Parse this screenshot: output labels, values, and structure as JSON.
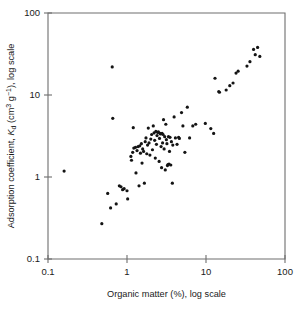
{
  "chart_data": {
    "type": "scatter",
    "title": "",
    "xlabel": "Organic matter (%), log scale",
    "ylabel": "Adsorption coefficient, Kd (cm3 g-1), log scale",
    "ylabel_parts": {
      "prefix": "Adsorption coefficient, ",
      "symbol": "K",
      "subscript": "d",
      "unit_open": " (cm",
      "unit_sup1": "3",
      "unit_mid": " g",
      "unit_sup2": "-1",
      "unit_close": "), log scale"
    },
    "xscale": "log",
    "yscale": "log",
    "xlim": [
      0.1,
      100
    ],
    "ylim": [
      0.1,
      100
    ],
    "xticks": [
      0.1,
      1,
      10,
      100
    ],
    "xtick_labels": [
      "0.1",
      "1",
      "10",
      "100"
    ],
    "yticks": [
      0.1,
      1,
      10,
      100
    ],
    "ytick_labels": [
      "0.1",
      "1",
      "10",
      "100"
    ],
    "grid": false,
    "legend": false,
    "marker": "filled-circle",
    "marker_color": "#141414",
    "marker_size_px": 3.2,
    "n_points": 104,
    "points": [
      [
        0.16,
        1.18
      ],
      [
        0.48,
        0.27
      ],
      [
        0.57,
        0.63
      ],
      [
        0.62,
        0.42
      ],
      [
        0.65,
        22.0
      ],
      [
        0.66,
        5.2
      ],
      [
        0.73,
        0.47
      ],
      [
        0.8,
        0.78
      ],
      [
        0.84,
        0.76
      ],
      [
        0.88,
        0.7
      ],
      [
        0.92,
        0.72
      ],
      [
        1.0,
        0.68
      ],
      [
        1.02,
        0.54
      ],
      [
        1.12,
        1.78
      ],
      [
        1.14,
        1.6
      ],
      [
        1.18,
        2.0
      ],
      [
        1.2,
        4.0
      ],
      [
        1.22,
        2.25
      ],
      [
        1.28,
        2.3
      ],
      [
        1.3,
        1.12
      ],
      [
        1.34,
        2.1
      ],
      [
        1.38,
        2.35
      ],
      [
        1.42,
        0.78
      ],
      [
        1.45,
        2.4
      ],
      [
        1.48,
        1.95
      ],
      [
        1.52,
        2.55
      ],
      [
        1.55,
        1.48
      ],
      [
        1.58,
        2.2
      ],
      [
        1.62,
        2.05
      ],
      [
        1.66,
        0.84
      ],
      [
        1.7,
        2.7
      ],
      [
        1.74,
        3.0
      ],
      [
        1.78,
        1.92
      ],
      [
        1.82,
        2.45
      ],
      [
        1.86,
        3.95
      ],
      [
        1.9,
        2.6
      ],
      [
        1.95,
        1.85
      ],
      [
        2.0,
        2.9
      ],
      [
        2.05,
        3.3
      ],
      [
        2.1,
        2.15
      ],
      [
        2.15,
        4.2
      ],
      [
        2.2,
        3.45
      ],
      [
        2.24,
        2.8
      ],
      [
        2.28,
        1.7
      ],
      [
        2.32,
        3.6
      ],
      [
        2.36,
        2.5
      ],
      [
        2.4,
        3.2
      ],
      [
        2.45,
        3.5
      ],
      [
        2.5,
        3.55
      ],
      [
        2.55,
        1.55
      ],
      [
        2.58,
        2.95
      ],
      [
        2.62,
        3.4
      ],
      [
        2.66,
        3.35
      ],
      [
        2.7,
        2.35
      ],
      [
        2.74,
        1.3
      ],
      [
        2.78,
        3.4
      ],
      [
        2.82,
        2.6
      ],
      [
        2.86,
        3.3
      ],
      [
        2.9,
        5.0
      ],
      [
        2.95,
        2.2
      ],
      [
        3.0,
        3.1
      ],
      [
        3.05,
        1.22
      ],
      [
        3.1,
        4.4
      ],
      [
        3.15,
        2.85
      ],
      [
        3.2,
        2.55
      ],
      [
        3.25,
        1.38
      ],
      [
        3.3,
        1.42
      ],
      [
        3.35,
        3.1
      ],
      [
        3.4,
        1.44
      ],
      [
        3.45,
        2.05
      ],
      [
        3.5,
        3.05
      ],
      [
        3.58,
        1.4
      ],
      [
        3.65,
        2.7
      ],
      [
        3.75,
        0.84
      ],
      [
        3.8,
        2.45
      ],
      [
        3.95,
        5.4
      ],
      [
        4.1,
        3.0
      ],
      [
        4.3,
        2.5
      ],
      [
        4.5,
        3.05
      ],
      [
        4.6,
        2.95
      ],
      [
        4.9,
        6.1
      ],
      [
        5.1,
        4.2
      ],
      [
        5.4,
        2.0
      ],
      [
        5.8,
        7.1
      ],
      [
        6.2,
        3.0
      ],
      [
        6.8,
        4.2
      ],
      [
        7.4,
        4.4
      ],
      [
        9.8,
        4.5
      ],
      [
        11.5,
        3.9
      ],
      [
        12.5,
        3.4
      ],
      [
        13.0,
        16.0
      ],
      [
        14.5,
        11.0
      ],
      [
        14.8,
        10.8
      ],
      [
        18.0,
        11.5
      ],
      [
        20.0,
        13.0
      ],
      [
        22.0,
        14.0
      ],
      [
        24.0,
        18.5
      ],
      [
        25.5,
        19.5
      ],
      [
        33.0,
        22.5
      ],
      [
        36.0,
        25.5
      ],
      [
        40.0,
        36.0
      ],
      [
        42.0,
        31.0
      ],
      [
        45.0,
        38.0
      ],
      [
        48.0,
        29.5
      ]
    ]
  }
}
